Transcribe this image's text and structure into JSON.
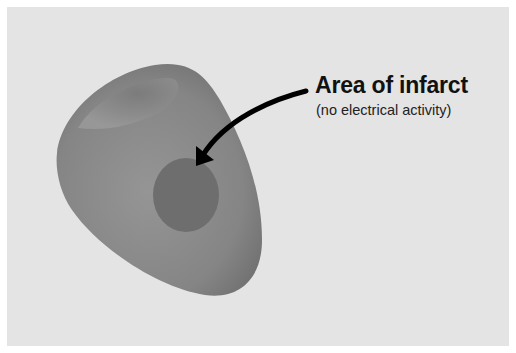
{
  "figure": {
    "label": {
      "title": "Area of infarct",
      "subtitle": "(no electrical activity)"
    },
    "colors": {
      "background": "#e4e4e4",
      "frame": "#ffffff",
      "heart_tissue": "#8a8a8a",
      "infarct_area": "#6e6e6e",
      "arrow": "#000000"
    }
  }
}
